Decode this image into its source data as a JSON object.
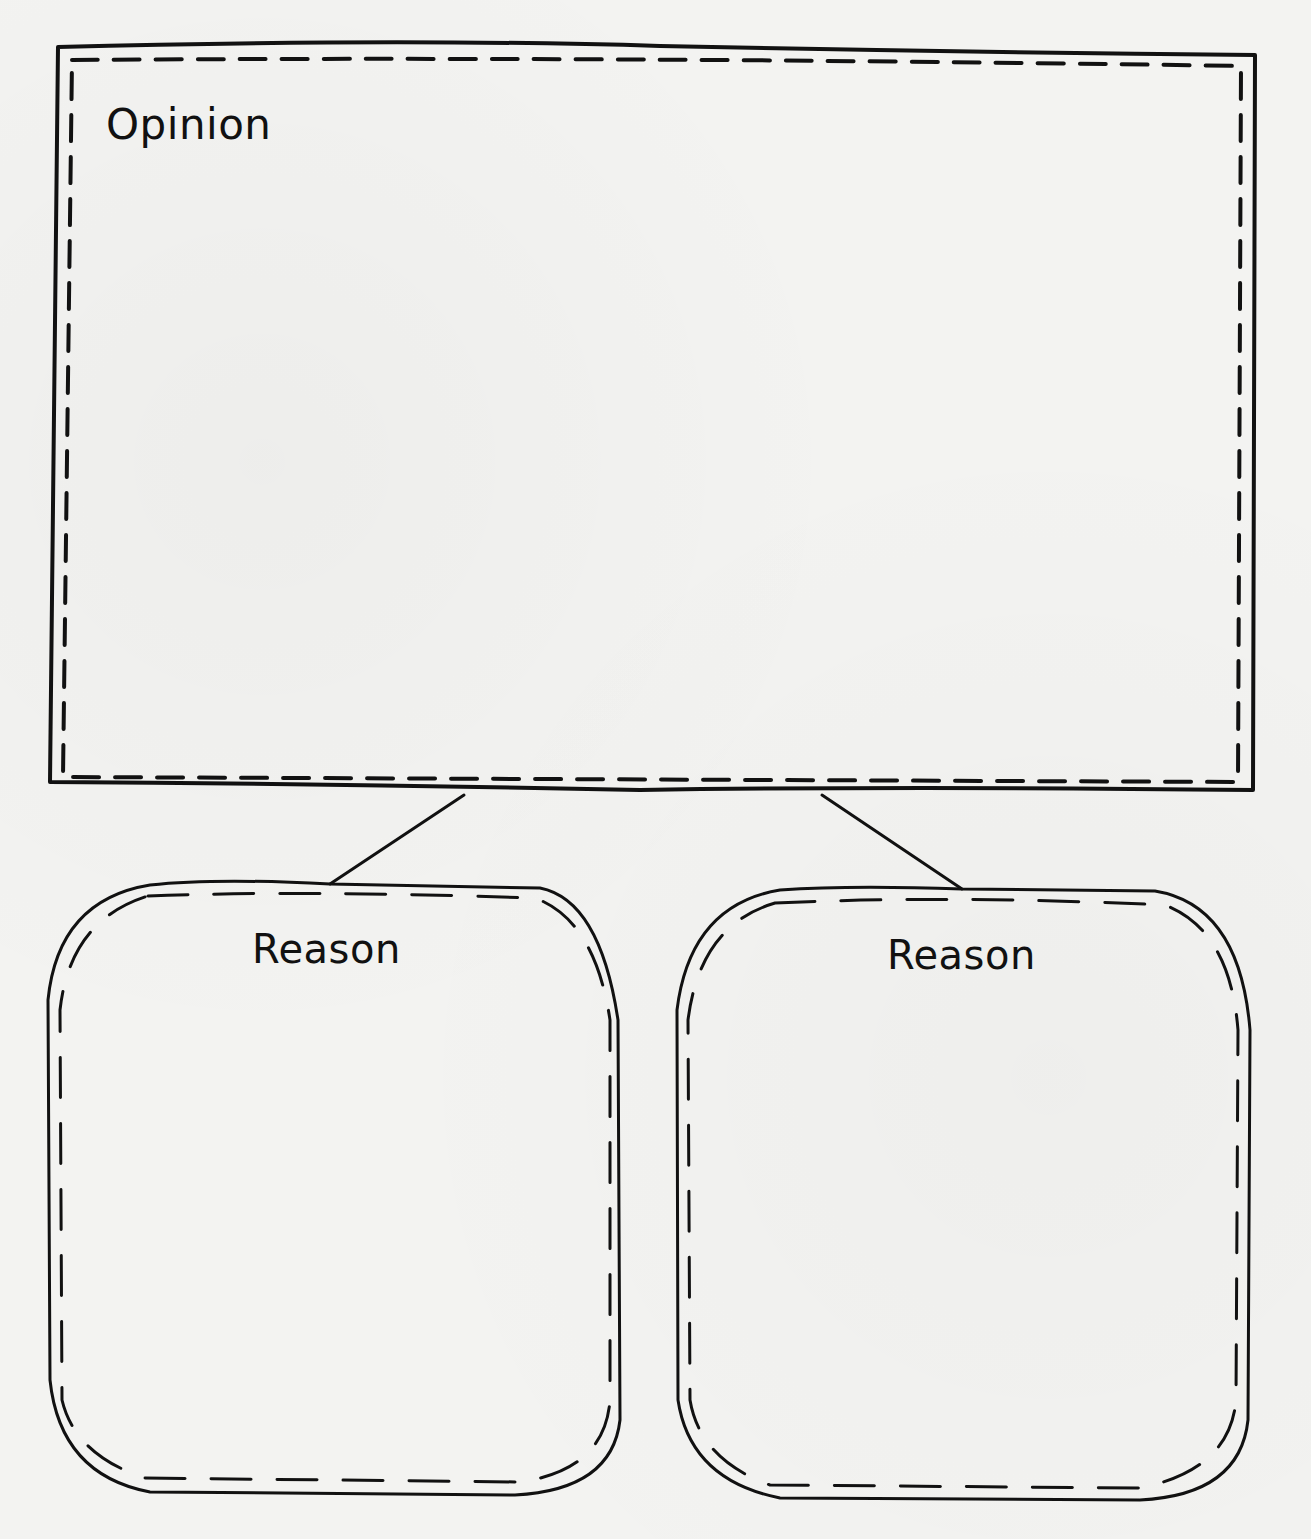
{
  "organizer": {
    "opinion": {
      "label": "Opinion"
    },
    "reasons": [
      {
        "label": "Reason"
      },
      {
        "label": "Reason"
      }
    ]
  },
  "colors": {
    "ink": "#111111",
    "paper": "#f3f3f1"
  }
}
